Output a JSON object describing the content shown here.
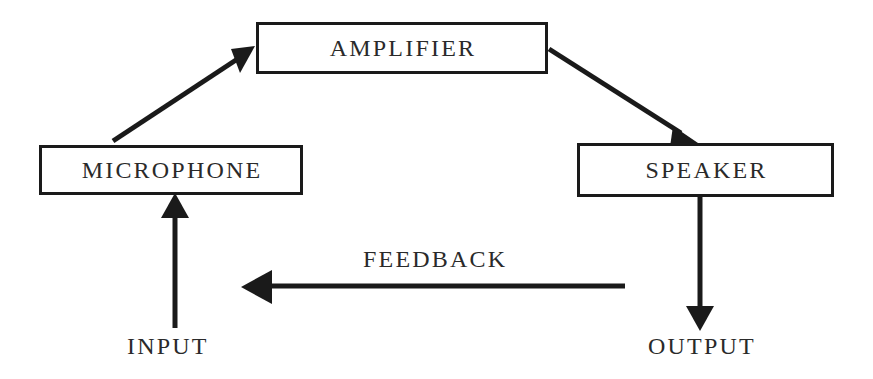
{
  "diagram": {
    "background_color": "#ffffff",
    "stroke_color": "#1a1a1a",
    "text_color": "#2a2a2a",
    "nodes": [
      {
        "id": "amplifier",
        "label": "AMPLIFIER"
      },
      {
        "id": "microphone",
        "label": "MICROPHONE"
      },
      {
        "id": "speaker",
        "label": "SPEAKER"
      }
    ],
    "edge_labels": [
      {
        "id": "feedback",
        "label": "FEEDBACK"
      }
    ],
    "terminal_labels": [
      {
        "id": "input",
        "label": "INPUT"
      },
      {
        "id": "output",
        "label": "OUTPUT"
      }
    ],
    "connectors": [
      {
        "id": "microphone-to-amplifier",
        "from": "microphone",
        "to": "amplifier",
        "direction": "up-right"
      },
      {
        "id": "amplifier-to-speaker",
        "from": "amplifier",
        "to": "speaker",
        "direction": "down-right"
      },
      {
        "id": "speaker-to-output",
        "from": "speaker",
        "to": "output",
        "direction": "down"
      },
      {
        "id": "input-to-microphone",
        "from": "input",
        "to": "microphone",
        "direction": "up"
      },
      {
        "id": "feedback-loop",
        "from": "speaker",
        "to": "microphone",
        "direction": "left"
      }
    ]
  }
}
